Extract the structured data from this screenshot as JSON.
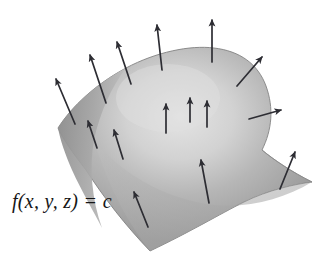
{
  "figure": {
    "kind": "level-surface-gradient-diagram",
    "background_color": "#ffffff",
    "label": {
      "text": "f(x, y, z) = c",
      "style": "italic-serif",
      "color": "#161616"
    },
    "surface": {
      "name": "level-surface",
      "description": "shaded curved saddle-like level surface patch",
      "fill_light": "#e2e2e2",
      "fill_mid": "#b2b2b2",
      "fill_dark": "#8d8d8d",
      "edge_color": "#7e7e7e",
      "highlight_center": "#dcdcdc"
    },
    "vectors": {
      "name": "gradient-normal-vectors",
      "color": "#2d2d33",
      "count": 15,
      "description": "arrows normal to the level surface pointing outward",
      "arrows": [
        {
          "id": "arrow-1",
          "x1": 75,
          "y1": 124,
          "x2": 56,
          "y2": 79,
          "len": 49
        },
        {
          "id": "arrow-2",
          "x1": 106,
          "y1": 103,
          "x2": 90,
          "y2": 55,
          "len": 51
        },
        {
          "id": "arrow-3",
          "x1": 131,
          "y1": 84,
          "x2": 117,
          "y2": 42,
          "len": 44
        },
        {
          "id": "arrow-4",
          "x1": 162,
          "y1": 70,
          "x2": 157,
          "y2": 25,
          "len": 45
        },
        {
          "id": "arrow-5",
          "x1": 212,
          "y1": 62,
          "x2": 212,
          "y2": 20,
          "len": 42
        },
        {
          "id": "arrow-6",
          "x1": 237,
          "y1": 86,
          "x2": 262,
          "y2": 57,
          "len": 38
        },
        {
          "id": "arrow-7",
          "x1": 249,
          "y1": 119,
          "x2": 281,
          "y2": 110,
          "len": 33
        },
        {
          "id": "arrow-8",
          "x1": 166,
          "y1": 133,
          "x2": 166,
          "y2": 104,
          "len": 29
        },
        {
          "id": "arrow-9",
          "x1": 207,
          "y1": 127,
          "x2": 207,
          "y2": 101,
          "len": 26
        },
        {
          "id": "arrow-10",
          "x1": 123,
          "y1": 159,
          "x2": 114,
          "y2": 130,
          "len": 30
        },
        {
          "id": "arrow-11",
          "x1": 148,
          "y1": 227,
          "x2": 134,
          "y2": 192,
          "len": 38
        },
        {
          "id": "arrow-12",
          "x1": 209,
          "y1": 203,
          "x2": 201,
          "y2": 160,
          "len": 44
        },
        {
          "id": "arrow-13",
          "x1": 280,
          "y1": 189,
          "x2": 295,
          "y2": 152,
          "len": 40
        },
        {
          "id": "arrow-14",
          "x1": 190,
          "y1": 122,
          "x2": 190,
          "y2": 98,
          "len": 24
        },
        {
          "id": "arrow-15",
          "x1": 97,
          "y1": 148,
          "x2": 88,
          "y2": 121,
          "len": 28
        }
      ]
    }
  }
}
